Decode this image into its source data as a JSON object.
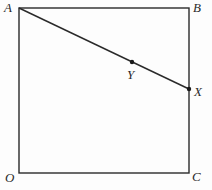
{
  "diagram": {
    "type": "geometry",
    "shape": "square",
    "points": {
      "A": {
        "label": "A",
        "x": 19,
        "y": 8
      },
      "B": {
        "label": "B",
        "x": 189,
        "y": 8
      },
      "C": {
        "label": "C",
        "x": 189,
        "y": 173
      },
      "O": {
        "label": "O",
        "x": 19,
        "y": 173
      },
      "X": {
        "label": "X",
        "x": 189,
        "y": 89
      },
      "Y": {
        "label": "Y",
        "x": 132,
        "y": 62
      }
    },
    "segments": [
      [
        "A",
        "B"
      ],
      [
        "B",
        "C"
      ],
      [
        "C",
        "O"
      ],
      [
        "O",
        "A"
      ],
      [
        "A",
        "X"
      ]
    ],
    "marked_points": [
      "X",
      "Y"
    ],
    "colors": {
      "stroke": "#2a2a2a",
      "background": "#fdfdfd"
    }
  }
}
